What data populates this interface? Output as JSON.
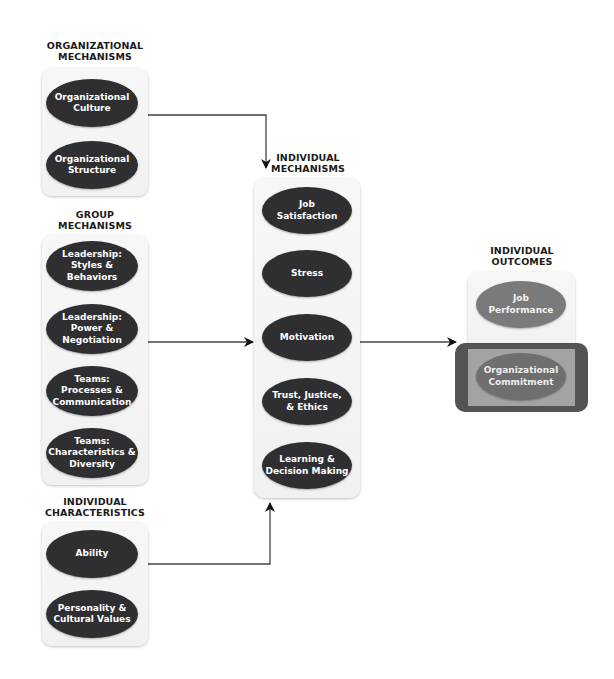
{
  "groups": {
    "organizational": {
      "heading_line1": "ORGANIZATIONAL",
      "heading_line2": "MECHANISMS",
      "items": [
        "Organizational Culture",
        "Organizational Structure"
      ]
    },
    "group": {
      "heading_line1": "GROUP",
      "heading_line2": "MECHANISMS",
      "items": [
        "Leadership: Styles & Behaviors",
        "Leadership: Power & Negotiation",
        "Teams: Processes & Communication",
        "Teams: Characteristics & Diversity"
      ]
    },
    "characteristics": {
      "heading_line1": "INDIVIDUAL",
      "heading_line2": "CHARACTERISTICS",
      "items": [
        "Ability",
        "Personality & Cultural Values"
      ]
    },
    "individual": {
      "heading_line1": "INDIVIDUAL",
      "heading_line2": "MECHANISMS",
      "items": [
        "Job Satisfaction",
        "Stress",
        "Motivation",
        "Trust, Justice, & Ethics",
        "Learning & Decision Making"
      ]
    },
    "outcomes": {
      "heading_line1": "INDIVIDUAL",
      "heading_line2": "OUTCOMES",
      "items": [
        "Job Performance",
        "Organizational Commitment"
      ]
    }
  },
  "labels": {
    "org_culture_1": "Organizational",
    "org_culture_2": "Culture",
    "org_structure_1": "Organizational",
    "org_structure_2": "Structure",
    "lead_styles_1": "Leadership:",
    "lead_styles_2": "Styles &",
    "lead_styles_3": "Behaviors",
    "lead_power_1": "Leadership:",
    "lead_power_2": "Power &",
    "lead_power_3": "Negotiation",
    "teams_proc_1": "Teams:",
    "teams_proc_2": "Processes &",
    "teams_proc_3": "Communication",
    "teams_char_1": "Teams:",
    "teams_char_2": "Characteristics &",
    "teams_char_3": "Diversity",
    "ability": "Ability",
    "personality_1": "Personality &",
    "personality_2": "Cultural Values",
    "job_sat_1": "Job",
    "job_sat_2": "Satisfaction",
    "stress": "Stress",
    "motivation": "Motivation",
    "trust_1": "Trust, Justice,",
    "trust_2": "& Ethics",
    "learning_1": "Learning &",
    "learning_2": "Decision Making",
    "job_perf_1": "Job",
    "job_perf_2": "Performance",
    "commit_1": "Organizational",
    "commit_2": "Commitment"
  },
  "colors": {
    "ellipse_dark": "#2f2f31",
    "ellipse_outcome": "#7a7a7a",
    "highlight_frame": "#545454",
    "highlight_inner": "#a3a3a3",
    "connector": "#333333"
  }
}
